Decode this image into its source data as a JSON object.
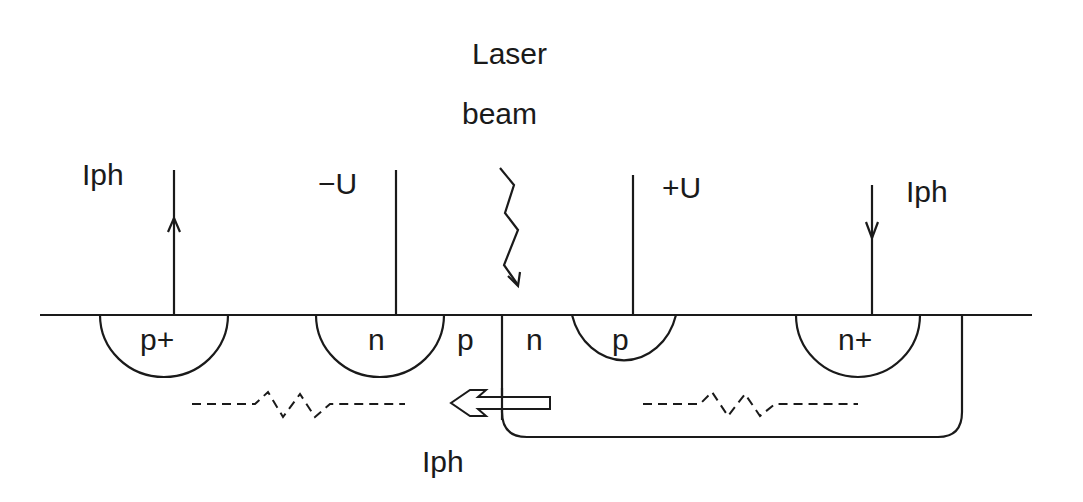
{
  "diagram": {
    "title_lines": [
      "Laser",
      "beam"
    ],
    "labels": {
      "iph_left": "Iph",
      "minus_u": "−U",
      "plus_u": "+U",
      "iph_right": "Iph",
      "iph_bottom": "Iph"
    },
    "regions": [
      {
        "name": "p-plus",
        "label": "p+"
      },
      {
        "name": "n-left",
        "label": "n"
      },
      {
        "name": "p-substrate",
        "label": "p"
      },
      {
        "name": "n-well",
        "label": "n"
      },
      {
        "name": "p-right",
        "label": "p"
      },
      {
        "name": "n-plus",
        "label": "n+"
      }
    ],
    "colors": {
      "ink": "#1a1a1a",
      "background": "#ffffff"
    }
  }
}
